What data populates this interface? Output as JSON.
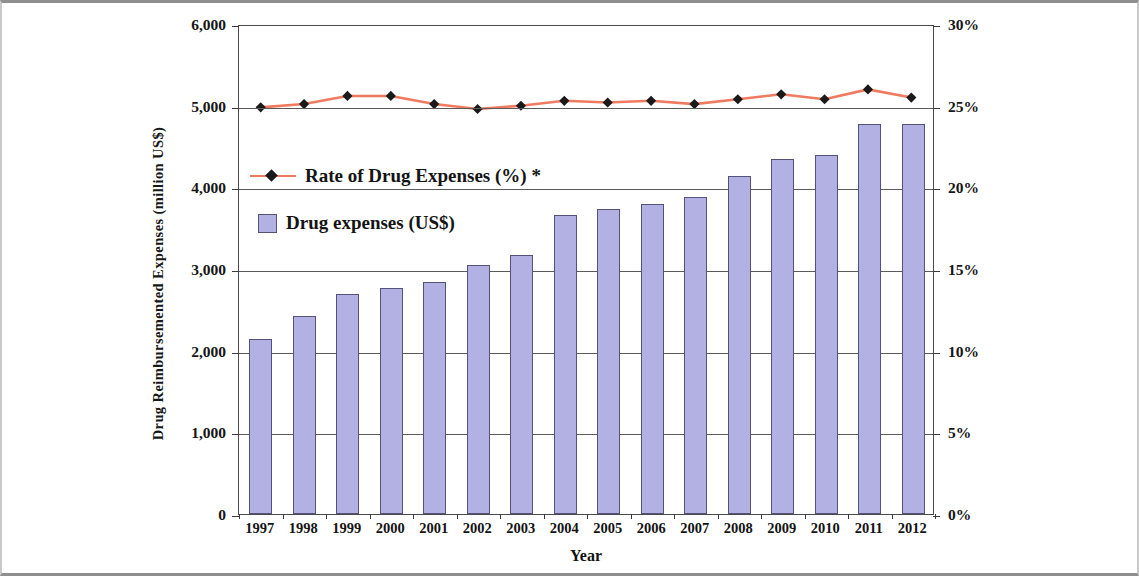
{
  "chart_data": {
    "type": "bar",
    "title": "",
    "xlabel": "Year",
    "ylabel": "Drug Reimbursemented Expenses (million US$)",
    "y2label": "",
    "categories": [
      "1997",
      "1998",
      "1999",
      "2000",
      "2001",
      "2002",
      "2003",
      "2004",
      "2005",
      "2006",
      "2007",
      "2008",
      "2009",
      "2010",
      "2011",
      "2012"
    ],
    "ylim": [
      0,
      6000
    ],
    "y2lim": [
      0,
      30
    ],
    "yticks": [
      "0",
      "1,000",
      "2,000",
      "3,000",
      "4,000",
      "5,000",
      "6,000"
    ],
    "ytick_values": [
      0,
      1000,
      2000,
      3000,
      4000,
      5000,
      6000
    ],
    "y2ticks": [
      "0%",
      "5%",
      "10%",
      "15%",
      "20%",
      "25%",
      "30%"
    ],
    "y2tick_values": [
      0,
      5,
      10,
      15,
      20,
      25,
      30
    ],
    "grid": true,
    "legend_position": "inside-upper-left",
    "series": [
      {
        "name": "Drug expenses (US$)",
        "type": "bar",
        "axis": "left",
        "color": "#b3b0e4",
        "edge_color": "#53527a",
        "values": [
          2140,
          2420,
          2690,
          2770,
          2840,
          3050,
          3170,
          3660,
          3740,
          3790,
          3880,
          4140,
          4350,
          4390,
          4780,
          4770
        ]
      },
      {
        "name": "Rate of Drug Expenses (%) *",
        "type": "line",
        "axis": "right",
        "color": "#f07a5f",
        "marker": "diamond",
        "marker_color": "#1a1a1a",
        "values": [
          25.0,
          25.2,
          25.7,
          25.7,
          25.2,
          24.9,
          25.1,
          25.4,
          25.3,
          25.4,
          25.2,
          25.5,
          25.8,
          25.5,
          26.1,
          25.6
        ]
      }
    ]
  },
  "legend": {
    "line_label": "Rate of Drug Expenses (%) *",
    "bar_label": "Drug expenses (US$)"
  }
}
